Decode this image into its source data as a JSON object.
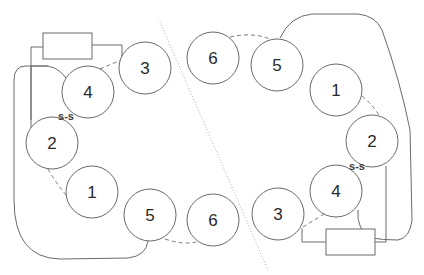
{
  "diagram": {
    "left_structure": {
      "nodes": [
        {
          "id": "3",
          "label": "3",
          "cx": 145,
          "cy": 68
        },
        {
          "id": "4",
          "label": "4",
          "cx": 88,
          "cy": 92
        },
        {
          "id": "2",
          "label": "2",
          "cx": 52,
          "cy": 143
        },
        {
          "id": "1",
          "label": "1",
          "cx": 92,
          "cy": 192
        },
        {
          "id": "5",
          "label": "5",
          "cx": 150,
          "cy": 215
        },
        {
          "id": "6",
          "label": "6",
          "cx": 213,
          "cy": 220
        }
      ],
      "disulfide_label": "s-s",
      "box": {
        "x": 43,
        "y": 33,
        "w": 49,
        "h": 26
      }
    },
    "right_structure": {
      "nodes": [
        {
          "id": "6",
          "label": "6",
          "cx": 213,
          "cy": 58
        },
        {
          "id": "5",
          "label": "5",
          "cx": 277,
          "cy": 65
        },
        {
          "id": "1",
          "label": "1",
          "cx": 336,
          "cy": 90
        },
        {
          "id": "2",
          "label": "2",
          "cx": 372,
          "cy": 141
        },
        {
          "id": "4",
          "label": "4",
          "cx": 336,
          "cy": 191
        },
        {
          "id": "3",
          "label": "3",
          "cx": 278,
          "cy": 214
        }
      ],
      "disulfide_label": "s-s",
      "box": {
        "x": 326,
        "y": 229,
        "w": 49,
        "h": 26
      }
    },
    "colors": {
      "stroke": "#6a6a6a",
      "text": "#2a2a2a",
      "background": "#ffffff"
    }
  }
}
